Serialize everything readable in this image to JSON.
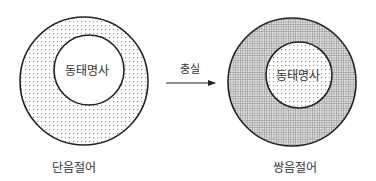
{
  "diagram": {
    "left": {
      "outer_label": "단음절어",
      "inner_label": "동태명사",
      "outer_fill": "sparse-dots"
    },
    "arrow": {
      "label": "충실",
      "direction": "right"
    },
    "right": {
      "outer_label": "쌍음절어",
      "inner_label": "동태명사",
      "outer_fill": "dense-grid",
      "inner_fill": "sparse-dots"
    },
    "colors": {
      "stroke": "#222222",
      "text": "#333333",
      "dots": "#8a8a8a",
      "grid": "#9a9a9a"
    }
  }
}
